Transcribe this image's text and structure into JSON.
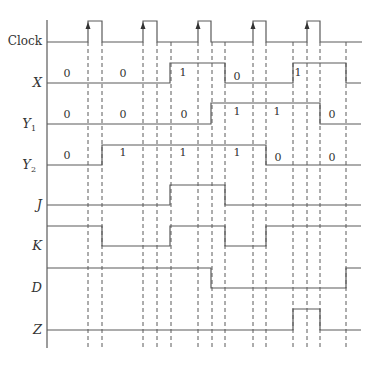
{
  "diagram": {
    "type": "timing-diagram",
    "axis": {
      "x": 47,
      "y_top": 20,
      "y_bottom": 348
    },
    "clock_edges_dashed_x": [
      88,
      102,
      143,
      157,
      171,
      198,
      212,
      225,
      253,
      266,
      293,
      307,
      320,
      346
    ],
    "signals": [
      {
        "id": "clock",
        "label": "Clock",
        "italic": false,
        "subscript": "",
        "label_y": 45,
        "high_y": 21,
        "low_y": 42,
        "points": [
          [
            47,
            42
          ],
          [
            88,
            42
          ],
          [
            88,
            21
          ],
          [
            102,
            21
          ],
          [
            102,
            42
          ],
          [
            143,
            42
          ],
          [
            143,
            21
          ],
          [
            157,
            21
          ],
          [
            157,
            42
          ],
          [
            198,
            42
          ],
          [
            198,
            21
          ],
          [
            211,
            21
          ],
          [
            211,
            42
          ],
          [
            253,
            42
          ],
          [
            253,
            21
          ],
          [
            266,
            21
          ],
          [
            266,
            42
          ],
          [
            307,
            42
          ],
          [
            307,
            21
          ],
          [
            320,
            21
          ],
          [
            320,
            42
          ],
          [
            362,
            42
          ]
        ],
        "arrows_x": [
          88,
          143,
          198,
          253,
          307
        ],
        "values": []
      },
      {
        "id": "x",
        "label": "X",
        "italic": true,
        "subscript": "",
        "label_y": 87,
        "high_y": 63,
        "low_y": 83,
        "points": [
          [
            47,
            83
          ],
          [
            170,
            83
          ],
          [
            170,
            63
          ],
          [
            225,
            63
          ],
          [
            225,
            83
          ],
          [
            293,
            83
          ],
          [
            293,
            63
          ],
          [
            346,
            63
          ],
          [
            346,
            83
          ],
          [
            361,
            83
          ]
        ],
        "values": [
          {
            "text": "0",
            "x": 67,
            "y": 77
          },
          {
            "text": "0",
            "x": 123,
            "y": 77
          },
          {
            "text": "1",
            "x": 183,
            "y": 76
          },
          {
            "text": "0",
            "x": 237,
            "y": 80
          },
          {
            "text": "1",
            "x": 298,
            "y": 76
          }
        ]
      },
      {
        "id": "y1",
        "label": "Y",
        "italic": true,
        "subscript": "1",
        "label_y": 128,
        "high_y": 103,
        "low_y": 124,
        "points": [
          [
            47,
            124
          ],
          [
            211,
            124
          ],
          [
            211,
            103
          ],
          [
            320,
            103
          ],
          [
            320,
            124
          ],
          [
            361,
            124
          ]
        ],
        "values": [
          {
            "text": "0",
            "x": 67,
            "y": 118
          },
          {
            "text": "0",
            "x": 123,
            "y": 118
          },
          {
            "text": "0",
            "x": 184,
            "y": 118
          },
          {
            "text": "1",
            "x": 237,
            "y": 115
          },
          {
            "text": "1",
            "x": 277,
            "y": 115
          },
          {
            "text": "0",
            "x": 332,
            "y": 118
          }
        ]
      },
      {
        "id": "y2",
        "label": "Y",
        "italic": true,
        "subscript": "2",
        "label_y": 169,
        "high_y": 145,
        "low_y": 165,
        "points": [
          [
            47,
            165
          ],
          [
            102,
            165
          ],
          [
            102,
            145
          ],
          [
            266,
            145
          ],
          [
            266,
            165
          ],
          [
            361,
            165
          ]
        ],
        "values": [
          {
            "text": "0",
            "x": 67,
            "y": 159
          },
          {
            "text": "1",
            "x": 123,
            "y": 156
          },
          {
            "text": "1",
            "x": 183,
            "y": 156
          },
          {
            "text": "1",
            "x": 237,
            "y": 156
          },
          {
            "text": "0",
            "x": 278,
            "y": 161
          },
          {
            "text": "0",
            "x": 332,
            "y": 161
          }
        ]
      },
      {
        "id": "j",
        "label": "J",
        "italic": true,
        "subscript": "",
        "label_y": 209,
        "high_y": 185,
        "low_y": 205,
        "points": [
          [
            47,
            205
          ],
          [
            170,
            205
          ],
          [
            170,
            185
          ],
          [
            225,
            185
          ],
          [
            225,
            205
          ],
          [
            361,
            205
          ]
        ],
        "values": []
      },
      {
        "id": "k",
        "label": "K",
        "italic": true,
        "subscript": "",
        "label_y": 250,
        "high_y": 226,
        "low_y": 246,
        "points": [
          [
            47,
            226
          ],
          [
            102,
            226
          ],
          [
            102,
            246
          ],
          [
            170,
            246
          ],
          [
            170,
            226
          ],
          [
            225,
            226
          ],
          [
            225,
            246
          ],
          [
            266,
            246
          ],
          [
            266,
            226
          ],
          [
            361,
            226
          ]
        ],
        "values": []
      },
      {
        "id": "d",
        "label": "D",
        "italic": true,
        "subscript": "",
        "label_y": 292,
        "high_y": 268,
        "low_y": 288,
        "points": [
          [
            47,
            268
          ],
          [
            211,
            268
          ],
          [
            211,
            288
          ],
          [
            346,
            288
          ],
          [
            346,
            268
          ],
          [
            361,
            268
          ]
        ],
        "values": []
      },
      {
        "id": "z",
        "label": "Z",
        "italic": true,
        "subscript": "",
        "label_y": 334,
        "high_y": 309,
        "low_y": 330,
        "points": [
          [
            47,
            330
          ],
          [
            293,
            330
          ],
          [
            293,
            309
          ],
          [
            320,
            309
          ],
          [
            320,
            330
          ],
          [
            361,
            330
          ]
        ],
        "values": []
      }
    ]
  }
}
